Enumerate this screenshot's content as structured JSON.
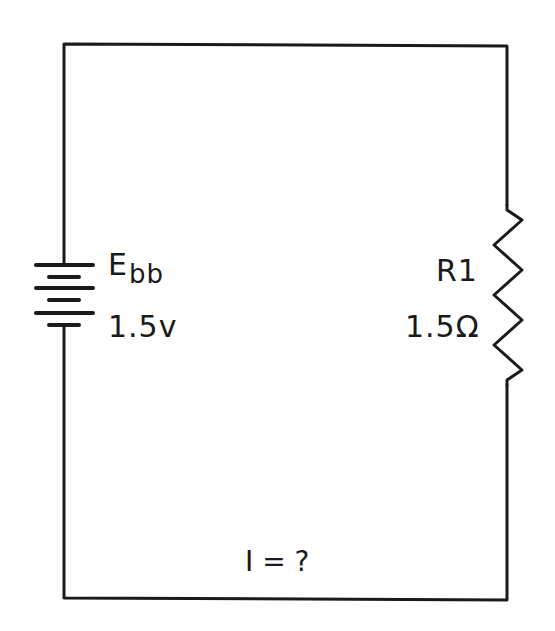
{
  "diagram": {
    "type": "series-circuit",
    "battery": {
      "symbol": "E",
      "subscript": "bb",
      "value": "1.5v"
    },
    "resistor": {
      "name": "R1",
      "value": "1.5Ω"
    },
    "current": {
      "label": "I = ?"
    },
    "colors": {
      "line": "#1a1a1a",
      "background": "#ffffff"
    }
  }
}
